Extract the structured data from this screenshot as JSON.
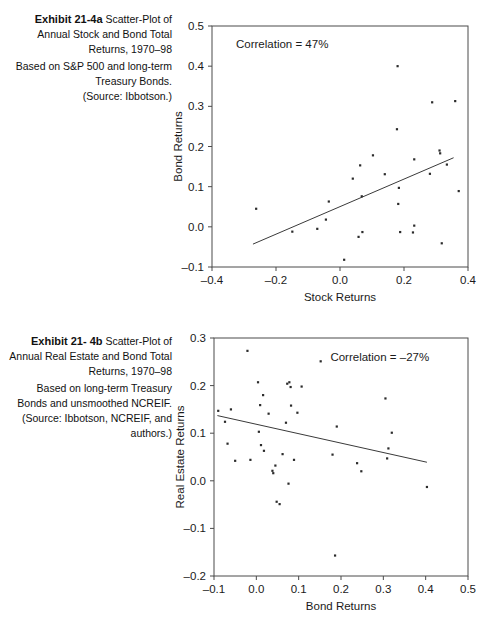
{
  "page": {
    "width": 496,
    "height": 642,
    "background": "#ffffff",
    "ink": "#1a1a1a"
  },
  "exhibit_a": {
    "caption": {
      "label": "Exhibit 21-4a",
      "title": "Scatter-Plot of Annual Stock and Bond Total Returns, 1970–98",
      "note": "Based on S&P 500 and long-term Treasury Bonds.",
      "source": "(Source: Ibbotson.)"
    },
    "annotation": "Correlation = 47%"
  },
  "exhibit_b": {
    "caption": {
      "label": "Exhibit 21- 4b",
      "title": "Scatter-Plot of Annual Real Estate and Bond Total Returns, 1970–98",
      "note": "Based on long-term Treasury Bonds and unsmoothed NCREIF.",
      "source": "(Source: Ibbotson, NCREIF, and authors.)"
    },
    "annotation": "Correlation = –27%"
  },
  "chart_data": [
    {
      "type": "scatter",
      "id": "exhibit-21-4a",
      "title": "Exhibit 21-4a Scatter-Plot of Annual Stock and Bond Total Returns, 1970–98",
      "xlabel": "Stock Returns",
      "ylabel": "Bond Returns",
      "xlim": [
        -0.4,
        0.4
      ],
      "ylim": [
        -0.1,
        0.5
      ],
      "xticks": [
        -0.4,
        -0.2,
        0.0,
        0.2,
        0.4
      ],
      "xticklabels": [
        "–0.4",
        "–0.2",
        "0.0",
        "0.2",
        "0.4"
      ],
      "yticks": [
        -0.1,
        0.0,
        0.1,
        0.2,
        0.3,
        0.4,
        0.5
      ],
      "yticklabels": [
        "–0.1",
        "0.0",
        "0.1",
        "0.2",
        "0.3",
        "0.4",
        "0.5"
      ],
      "grid": false,
      "legend": null,
      "annotation": "Correlation = 47%",
      "annotation_xy": [
        -0.325,
        0.445
      ],
      "correlation": 0.47,
      "trendline": {
        "x": [
          -0.272,
          0.355
        ],
        "y": [
          -0.043,
          0.172
        ]
      },
      "points": [
        [
          -0.262,
          0.045
        ],
        [
          -0.149,
          -0.012
        ],
        [
          -0.071,
          -0.005
        ],
        [
          -0.044,
          0.018
        ],
        [
          -0.035,
          0.063
        ],
        [
          0.013,
          -0.082
        ],
        [
          0.04,
          0.12
        ],
        [
          0.058,
          -0.025
        ],
        [
          0.063,
          0.153
        ],
        [
          0.068,
          0.076
        ],
        [
          0.07,
          -0.013
        ],
        [
          0.103,
          0.178
        ],
        [
          0.14,
          0.131
        ],
        [
          0.178,
          0.243
        ],
        [
          0.18,
          0.4
        ],
        [
          0.182,
          0.057
        ],
        [
          0.184,
          0.097
        ],
        [
          0.188,
          -0.013
        ],
        [
          0.228,
          -0.014
        ],
        [
          0.232,
          0.168
        ],
        [
          0.232,
          0.003
        ],
        [
          0.281,
          0.132
        ],
        [
          0.288,
          0.31
        ],
        [
          0.311,
          0.19
        ],
        [
          0.313,
          0.183
        ],
        [
          0.318,
          -0.041
        ],
        [
          0.334,
          0.155
        ],
        [
          0.36,
          0.313
        ],
        [
          0.371,
          0.089
        ]
      ]
    },
    {
      "type": "scatter",
      "id": "exhibit-21-4b",
      "title": "Exhibit 21-4b Scatter-Plot of Annual Real Estate and Bond Total Returns, 1970–98",
      "xlabel": "Bond Returns",
      "ylabel": "Real Estate Returns",
      "xlim": [
        -0.1,
        0.5
      ],
      "ylim": [
        -0.2,
        0.3
      ],
      "xticks": [
        -0.1,
        0.0,
        0.1,
        0.2,
        0.3,
        0.4,
        0.5
      ],
      "xticklabels": [
        "–0.1",
        "0.0",
        "0.1",
        "0.2",
        "0.3",
        "0.4",
        "0.5"
      ],
      "yticks": [
        -0.2,
        -0.1,
        0.0,
        0.1,
        0.2,
        0.3
      ],
      "yticklabels": [
        "–0.2",
        "–0.1",
        "0.0",
        "0.1",
        "0.2",
        "0.3"
      ],
      "grid": false,
      "legend": null,
      "annotation": "Correlation = –27%",
      "annotation_xy": [
        0.175,
        0.252
      ],
      "correlation": -0.27,
      "trendline": {
        "x": [
          -0.092,
          0.403
        ],
        "y": [
          0.137,
          0.039
        ]
      },
      "points": [
        [
          -0.09,
          0.147
        ],
        [
          -0.074,
          0.124
        ],
        [
          -0.068,
          0.078
        ],
        [
          -0.06,
          0.15
        ],
        [
          -0.05,
          0.042
        ],
        [
          -0.021,
          0.273
        ],
        [
          -0.014,
          0.044
        ],
        [
          0.004,
          0.207
        ],
        [
          0.006,
          0.103
        ],
        [
          0.009,
          0.159
        ],
        [
          0.011,
          0.075
        ],
        [
          0.016,
          0.18
        ],
        [
          0.018,
          0.063
        ],
        [
          0.029,
          0.141
        ],
        [
          0.038,
          0.021
        ],
        [
          0.04,
          0.016
        ],
        [
          0.045,
          0.032
        ],
        [
          0.048,
          -0.044
        ],
        [
          0.055,
          -0.049
        ],
        [
          0.062,
          0.056
        ],
        [
          0.07,
          0.122
        ],
        [
          0.073,
          0.204
        ],
        [
          0.076,
          -0.006
        ],
        [
          0.078,
          0.207
        ],
        [
          0.081,
          0.197
        ],
        [
          0.082,
          0.158
        ],
        [
          0.089,
          0.044
        ],
        [
          0.097,
          0.143
        ],
        [
          0.107,
          0.198
        ],
        [
          0.152,
          0.251
        ],
        [
          0.18,
          0.055
        ],
        [
          0.186,
          -0.157
        ],
        [
          0.19,
          0.114
        ],
        [
          0.238,
          0.037
        ],
        [
          0.248,
          0.02
        ],
        [
          0.305,
          0.173
        ],
        [
          0.309,
          0.047
        ],
        [
          0.312,
          0.068
        ],
        [
          0.32,
          0.101
        ],
        [
          0.403,
          -0.013
        ]
      ]
    }
  ]
}
